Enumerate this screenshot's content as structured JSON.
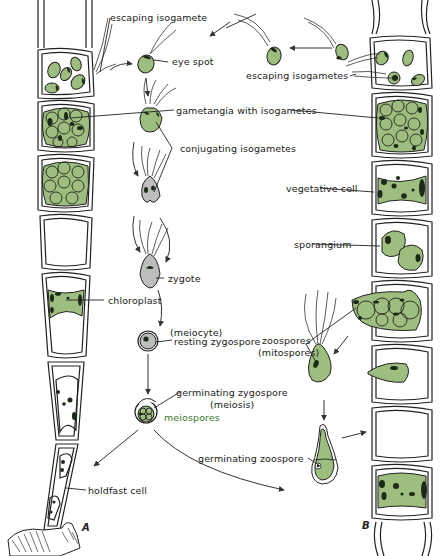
{
  "figure": {
    "panels": [
      {
        "id": "A",
        "label": "A",
        "description": "Filament with holdfast cell; sexual cycle via isogametes"
      },
      {
        "id": "B",
        "label": "B",
        "description": "Filament; asexual cycle via zoospores"
      }
    ],
    "colors": {
      "cytoplasm_green": "#9dbe7e",
      "chloroplast_dark": "#1c2a18",
      "zygote_grey": "#bdbdbd",
      "outline": "#222222",
      "meiospores_label": "#3d7a2e"
    }
  },
  "labels": {
    "escaping_isogamete": "escaping isogamete",
    "eye_spot": "eye spot",
    "escaping_isogametes": "escaping isogametes",
    "gametangia_with_isogametes": "gametangia  with  isogametes",
    "conjugating_isogametes": "conjugating isogametes",
    "vegetative_cell": "vegetative cell",
    "zygote": "zygote",
    "sporangium": "sporangium",
    "chloroplast": "chloroplast",
    "meiocyte": "(meiocyte)",
    "resting_zygospore": "resting zygospore",
    "zoospores": "zoospores",
    "mitospores": "(mitospores)",
    "germinating_zygospore": "germinating zygospore",
    "meiosis": "(meiosis)",
    "meiospores": "meiospores",
    "germinating_zoospore": "germinating zoospore",
    "holdfast_cell": "holdfast cell",
    "panel_a": "A",
    "panel_b": "B"
  }
}
